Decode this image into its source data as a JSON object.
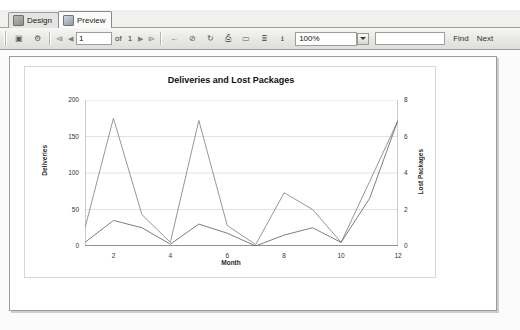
{
  "tabs": [
    {
      "label": "Design",
      "icon": "design-icon",
      "active": false
    },
    {
      "label": "Preview",
      "icon": "preview-icon",
      "active": true
    }
  ],
  "toolbar": {
    "page_current": "1",
    "page_of_label": "of",
    "page_total": "1",
    "zoom_value": "100%",
    "find_value": "",
    "find_label": "Find",
    "next_label": "Next",
    "buttons": [
      {
        "name": "document-map-button",
        "glyph": "▣"
      },
      {
        "name": "parameters-button",
        "glyph": "⚙"
      },
      {
        "name": "first-page-button",
        "glyph": "⧏"
      },
      {
        "name": "previous-page-button",
        "glyph": "◀"
      },
      {
        "name": "next-page-button",
        "glyph": "▶"
      },
      {
        "name": "last-page-button",
        "glyph": "⧐"
      },
      {
        "name": "back-to-parent-button",
        "glyph": "←"
      },
      {
        "name": "stop-rendering-button",
        "glyph": "⊘"
      },
      {
        "name": "refresh-button",
        "glyph": "↻"
      },
      {
        "name": "print-button",
        "glyph": "⎙"
      },
      {
        "name": "print-layout-button",
        "glyph": "▭"
      },
      {
        "name": "page-setup-button",
        "glyph": "⌸"
      },
      {
        "name": "export-button",
        "glyph": "⭳"
      }
    ]
  },
  "chart_data": {
    "type": "line",
    "title": "Deliveries and Lost Packages",
    "xlabel": "Month",
    "ylabel": "Deliveries",
    "y2label": "Lost Packages",
    "grid": true,
    "legend": "none",
    "x": [
      1,
      2,
      3,
      4,
      5,
      6,
      7,
      8,
      9,
      10,
      11,
      12
    ],
    "xlim": [
      1,
      12
    ],
    "xticks": [
      2,
      4,
      6,
      8,
      10,
      12
    ],
    "ylim": [
      0,
      200
    ],
    "yticks": [
      0,
      50,
      100,
      150,
      200
    ],
    "y2lim": [
      0,
      8
    ],
    "y2ticks": [
      0,
      2,
      4,
      6,
      8
    ],
    "series": [
      {
        "name": "Deliveries",
        "axis": "left",
        "color": "#8a8a8a",
        "values": [
          25,
          175,
          43,
          5,
          172,
          28,
          2,
          73,
          50,
          5,
          88,
          172
        ]
      },
      {
        "name": "Lost Packages",
        "axis": "right",
        "color": "#6e6e6e",
        "values": [
          0.2,
          1.4,
          1.0,
          0.1,
          1.2,
          0.7,
          0.0,
          0.6,
          1.0,
          0.2,
          2.6,
          6.9
        ]
      }
    ]
  }
}
